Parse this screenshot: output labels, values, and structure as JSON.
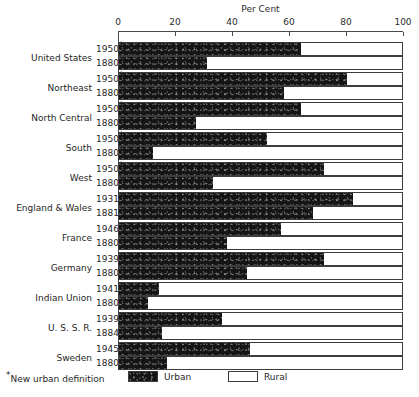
{
  "chart_data": {
    "type": "bar",
    "title": "Per Cent",
    "subtitle": "",
    "xlabel": "Per Cent",
    "ylabel": "",
    "xlim": [
      0,
      100
    ],
    "xticks": [
      0,
      20,
      40,
      60,
      80,
      100
    ],
    "xtick_labels": [
      "0",
      "20",
      "40",
      "60",
      "80",
      "100"
    ],
    "grid": false,
    "orientation": "horizontal",
    "stacked": true,
    "legend_position": "bottom",
    "legend": [
      "Urban",
      "Rural"
    ],
    "series": [
      {
        "name": "Urban",
        "color": "#151515"
      },
      {
        "name": "Rural",
        "color": "#ffffff"
      }
    ],
    "footnote": "New urban definition",
    "footnote_marker": "*",
    "groups": [
      {
        "label": "United States",
        "rows": [
          {
            "year": "1950",
            "marker": "*",
            "urban": 64,
            "rural": 36
          },
          {
            "year": "1880",
            "marker": "",
            "urban": 31,
            "rural": 69
          }
        ]
      },
      {
        "label": "Northeast",
        "rows": [
          {
            "year": "1950",
            "marker": "*",
            "urban": 80,
            "rural": 20
          },
          {
            "year": "1880",
            "marker": "",
            "urban": 58,
            "rural": 42
          }
        ]
      },
      {
        "label": "North Central",
        "rows": [
          {
            "year": "1950",
            "marker": "*",
            "urban": 64,
            "rural": 36
          },
          {
            "year": "1880",
            "marker": "",
            "urban": 27,
            "rural": 73
          }
        ]
      },
      {
        "label": "South",
        "rows": [
          {
            "year": "1950",
            "marker": "*",
            "urban": 52,
            "rural": 48
          },
          {
            "year": "1880",
            "marker": "",
            "urban": 12,
            "rural": 88
          }
        ]
      },
      {
        "label": "West",
        "rows": [
          {
            "year": "1950",
            "marker": "*",
            "urban": 72,
            "rural": 28
          },
          {
            "year": "1880",
            "marker": "",
            "urban": 33,
            "rural": 67
          }
        ]
      },
      {
        "label": "England & Wales",
        "rows": [
          {
            "year": "1931",
            "marker": "",
            "urban": 82,
            "rural": 18
          },
          {
            "year": "1881",
            "marker": "",
            "urban": 68,
            "rural": 32
          }
        ]
      },
      {
        "label": "France",
        "rows": [
          {
            "year": "1946",
            "marker": "",
            "urban": 57,
            "rural": 43
          },
          {
            "year": "1880",
            "marker": "",
            "urban": 38,
            "rural": 62
          }
        ]
      },
      {
        "label": "Germany",
        "rows": [
          {
            "year": "1939",
            "marker": "",
            "urban": 72,
            "rural": 28
          },
          {
            "year": "1880",
            "marker": "",
            "urban": 45,
            "rural": 55
          }
        ]
      },
      {
        "label": "Indian Union",
        "rows": [
          {
            "year": "1941",
            "marker": "",
            "urban": 14,
            "rural": 86
          },
          {
            "year": "1880",
            "marker": "",
            "urban": 10,
            "rural": 90
          }
        ]
      },
      {
        "label": "U. S. S. R.",
        "rows": [
          {
            "year": "1939",
            "marker": "",
            "urban": 36,
            "rural": 64
          },
          {
            "year": "1884",
            "marker": "",
            "urban": 15,
            "rural": 85
          }
        ]
      },
      {
        "label": "Sweden",
        "rows": [
          {
            "year": "1945",
            "marker": "",
            "urban": 46,
            "rural": 54
          },
          {
            "year": "1880",
            "marker": "",
            "urban": 17,
            "rural": 83
          }
        ]
      }
    ]
  }
}
